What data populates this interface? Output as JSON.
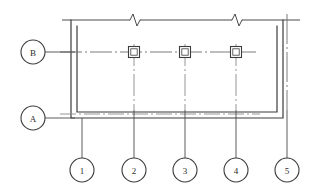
{
  "drawing": {
    "type": "architectural-floor-plan",
    "title": "Partial Framing Plan",
    "line_color": "#4a4a4a",
    "wall_color": "#3c3c3c",
    "centerline_color": "#6e6e6e",
    "text_color": "#2b2b2b",
    "background": "#ffffff"
  },
  "horizontal_grid": {
    "axis_label_position": "left",
    "bubbles": [
      {
        "label": "B",
        "cx": 33,
        "cy": 52,
        "r": 12,
        "leader_x2": 75
      },
      {
        "label": "A",
        "cx": 33,
        "cy": 118,
        "r": 12,
        "leader_x2": 75
      }
    ]
  },
  "vertical_grid": {
    "axis_label_position": "bottom",
    "bubbles": [
      {
        "label": "1",
        "cx": 82,
        "cy": 170,
        "r": 12,
        "leader_y1": 120
      },
      {
        "label": "2",
        "cx": 134,
        "cy": 170,
        "r": 12,
        "leader_y1": 52
      },
      {
        "label": "3",
        "cx": 185,
        "cy": 170,
        "r": 12,
        "leader_y1": 52
      },
      {
        "label": "4",
        "cx": 236,
        "cy": 170,
        "r": 12,
        "leader_y1": 52
      },
      {
        "label": "5",
        "cx": 287,
        "cy": 170,
        "r": 12,
        "leader_y1": 20
      }
    ]
  },
  "columns": [
    {
      "name": "column-2-B",
      "cx": 134,
      "cy": 52,
      "size": 11
    },
    {
      "name": "column-3-B",
      "cx": 185,
      "cy": 52,
      "size": 11
    },
    {
      "name": "column-4-B",
      "cx": 236,
      "cy": 52,
      "size": 11
    }
  ],
  "walls": {
    "outer": {
      "x1": 71,
      "y1": 20,
      "x2": 283,
      "y2": 118
    },
    "inner": {
      "x1": 77,
      "y1": 26,
      "x2": 277,
      "y2": 112
    },
    "note": "double-line walls on left, right and bottom; top edge open with break symbols"
  },
  "break_symbols": [
    {
      "name": "break-symbol-left",
      "x": 135,
      "y": 20
    },
    {
      "name": "break-symbol-right",
      "x": 237,
      "y": 20
    }
  ],
  "centerlines": {
    "axis_B": {
      "y": 52,
      "x1": 60,
      "x2": 256
    },
    "axis_A": {
      "y": 114,
      "x1": 60,
      "x2": 260
    }
  }
}
